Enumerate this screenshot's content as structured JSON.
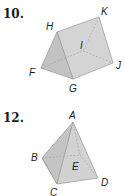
{
  "problems": [
    {
      "number": "10.",
      "shape": "triangular-prism",
      "vertex_labels": [
        "H",
        "K",
        "I",
        "F",
        "J",
        "G"
      ]
    },
    {
      "number": "12.",
      "shape": "square-pyramid",
      "vertex_labels": [
        "A",
        "B",
        "E",
        "D",
        "C"
      ]
    }
  ],
  "colors": {
    "face_fill": "#c8c8c8",
    "face_light": "#d6d6d6",
    "edge": "#9a9a9a",
    "text": "#1a1a1a"
  }
}
